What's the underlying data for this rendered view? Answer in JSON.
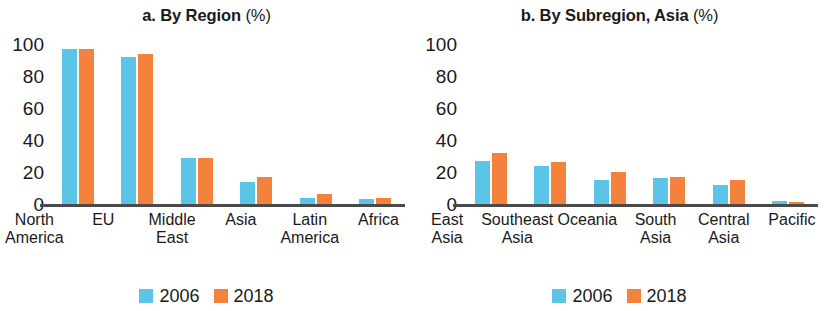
{
  "chart_data": [
    {
      "type": "bar",
      "panel_id": "a",
      "title": "a. By Region (%)",
      "title_main": "a. By Region",
      "title_unit": "(%)",
      "xlabel": "",
      "ylabel": "",
      "ylim": [
        0,
        100
      ],
      "yticks": [
        0,
        20,
        40,
        60,
        80,
        100
      ],
      "ytick_labels": [
        "0",
        "20",
        "40",
        "60",
        "80",
        "100"
      ],
      "grid": false,
      "legend_position": "bottom-center",
      "categories": [
        "North America",
        "EU",
        "Middle East",
        "Asia",
        "Latin America",
        "Africa"
      ],
      "series": [
        {
          "name": "2006",
          "color": "#5bc5e8",
          "values": [
            97,
            92,
            29,
            14,
            4,
            3
          ]
        },
        {
          "name": "2018",
          "color": "#f5823c",
          "values": [
            97,
            94,
            29,
            17,
            6,
            4
          ]
        }
      ],
      "legend": [
        "2006",
        "2018"
      ]
    },
    {
      "type": "bar",
      "panel_id": "b",
      "title": "b. By Subregion, Asia (%)",
      "title_main": "b. By Subregion, Asia",
      "title_unit": "(%)",
      "xlabel": "",
      "ylabel": "",
      "ylim": [
        0,
        100
      ],
      "yticks": [
        0,
        20,
        40,
        60,
        80,
        100
      ],
      "ytick_labels": [
        "0",
        "20",
        "40",
        "60",
        "80",
        "100"
      ],
      "grid": false,
      "legend_position": "bottom-center",
      "categories": [
        "East Asia",
        "Southeast Asia",
        "Oceania",
        "South Asia",
        "Central Asia",
        "Pacific"
      ],
      "series": [
        {
          "name": "2006",
          "color": "#5bc5e8",
          "values": [
            27,
            24,
            15,
            16,
            12,
            2
          ]
        },
        {
          "name": "2018",
          "color": "#f5823c",
          "values": [
            32,
            26,
            20,
            17,
            15,
            1
          ]
        }
      ],
      "legend": [
        "2006",
        "2018"
      ]
    }
  ],
  "colors": {
    "series_2006": "#5bc5e8",
    "series_2018": "#f5823c",
    "axis": "#4a4a4a",
    "text": "#1a1a1a",
    "background": "#ffffff"
  }
}
